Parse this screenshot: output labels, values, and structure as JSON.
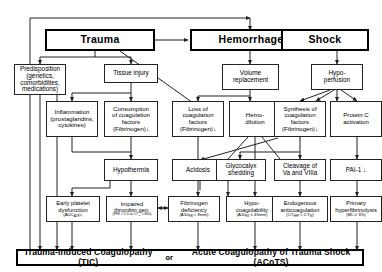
{
  "diagram": {
    "colors": {
      "line": "#222222",
      "box_border": "#222222",
      "emphasis_border": "#000000",
      "background": "#ffffff"
    },
    "tier1": [
      {
        "id": "trauma",
        "label": "Trauma"
      },
      {
        "id": "hemorrhage",
        "label": "Hemorrhage"
      },
      {
        "id": "shock",
        "label": "Shock"
      }
    ],
    "tier2": [
      {
        "id": "predisposition",
        "lines": [
          "Predisposition",
          "(genetics,",
          "comorbidities,",
          "medications)"
        ]
      },
      {
        "id": "tissue-injury",
        "lines": [
          "Tissue injury"
        ]
      },
      {
        "id": "volume-replacement",
        "lines": [
          "Volume",
          "replacement"
        ]
      },
      {
        "id": "hypoperfusion",
        "lines": [
          "Hypo-",
          "perfusion"
        ]
      }
    ],
    "tier3": [
      {
        "id": "inflammation",
        "lines": [
          "Inflammation",
          "(prostaglandins,",
          "cytokines)"
        ]
      },
      {
        "id": "consumption",
        "lines": [
          "Consumption",
          "of coagulation",
          "factors",
          "(Fibrinogen)↓"
        ]
      },
      {
        "id": "loss-of-factors",
        "lines": [
          "Loss of",
          "coagulation",
          "factors",
          "(Fibrinogen)↓"
        ]
      },
      {
        "id": "hemodilution",
        "lines": [
          "Hemo-",
          "dilution"
        ]
      },
      {
        "id": "synthesis",
        "lines": [
          "Synthesis of",
          "coagulation",
          "factors",
          "(Fibrinogen)↓"
        ]
      },
      {
        "id": "protein-c",
        "lines": [
          "Protein C",
          "activation"
        ]
      }
    ],
    "tier4": [
      {
        "id": "hypothermia",
        "lines": [
          "Hypothermia"
        ]
      },
      {
        "id": "acidosis",
        "lines": [
          "Acidosis"
        ]
      },
      {
        "id": "glycocalyx",
        "lines": [
          "Glycocalyx",
          "shedding"
        ]
      },
      {
        "id": "cleavage",
        "lines": [
          "Cleavage of",
          "Va and VIIIa"
        ]
      },
      {
        "id": "pai1",
        "lines": [
          "PAI-1 ↓"
        ]
      }
    ],
    "tier5": [
      {
        "id": "early-platelet-dysfunction",
        "lines": [
          "Early platelet",
          "dysfunction"
        ],
        "detail": "(AUC",
        "detail_sub": "ADP",
        "detail_tail": ")↓"
      },
      {
        "id": "impaired-thrombin",
        "lines": [
          "Impaired",
          "thrombin gen."
        ],
        "detail_small": "(PHI > 1.5 or CT",
        "detail_small_sub": "in",
        "detail_small_tail": " > 80s)"
      },
      {
        "id": "fibrinogen-deficiency",
        "lines": [
          "Fibrinogen",
          "deficiency"
        ],
        "detail": "(A10",
        "detail_sub": "FIB",
        "detail_tail": " < 8mm)"
      },
      {
        "id": "hypocoagulability",
        "lines": [
          "Hypo-",
          "coagulability"
        ],
        "detail": "(A10",
        "detail_sub": "EX",
        "detail_tail": " ≤ 45mm)"
      },
      {
        "id": "endogenous-anticoagulation",
        "lines": [
          "Endogenous",
          "anticoagulation"
        ],
        "detail": "(CT",
        "detail_sub": "HEP",
        "detail_tail": " < CT",
        "detail_sub2": "IN",
        "detail_tail2": ")"
      },
      {
        "id": "primary-hyperfibrinolysis",
        "lines": [
          "Primary",
          "hyperfibrinolysis"
        ],
        "detail": "(ML ≥ 3%)"
      }
    ],
    "summary": {
      "left": "Trauma-Induced Coagulopathy (TIC)",
      "connector": "or",
      "right": "Acute Coagulopathy of Trauma Shock (ACoTS)"
    }
  }
}
